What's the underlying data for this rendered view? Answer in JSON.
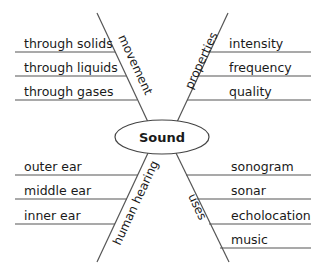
{
  "center": {
    "label": "Sound"
  },
  "branches": [
    {
      "category": "movement",
      "items": [
        "through solids",
        "through liquids",
        "through gases"
      ]
    },
    {
      "category": "properties",
      "items": [
        "intensity",
        "frequency",
        "quality"
      ]
    },
    {
      "category": "human hearing",
      "items": [
        "outer ear",
        "middle ear",
        "inner ear"
      ]
    },
    {
      "category": "uses",
      "items": [
        "sonogram",
        "sonar",
        "echolocation",
        "music"
      ]
    }
  ]
}
